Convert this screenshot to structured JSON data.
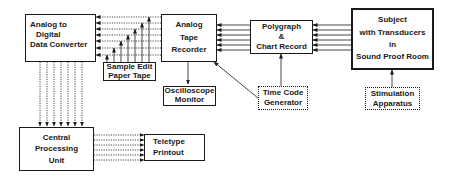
{
  "diagram": {
    "type": "block-diagram",
    "nodes": {
      "adc": {
        "lines": [
          "Analog  to",
          "Digital",
          "Data Converter"
        ],
        "border": "solid"
      },
      "tape": {
        "lines": [
          "Analog",
          "Tape",
          "Recorder"
        ],
        "border": "solid"
      },
      "poly": {
        "lines": [
          "Polygraph",
          "&",
          "Chart  Record"
        ],
        "border": "solid"
      },
      "subject": {
        "lines": [
          "Subject",
          "with Transducers",
          "in",
          "Sound Proof Room"
        ],
        "border": "thick"
      },
      "sample": {
        "lines": [
          "Sample  Edit",
          "Paper  Tape"
        ],
        "border": "solid"
      },
      "osc": {
        "lines": [
          "Oscilloscope",
          "Monitor"
        ],
        "border": "solid"
      },
      "tcg": {
        "lines": [
          "Time Code",
          "Generator"
        ],
        "border": "dotted"
      },
      "stim": {
        "lines": [
          "Stimulation",
          "Apparatus"
        ],
        "border": "dotted"
      },
      "cpu": {
        "lines": [
          "Central",
          "Processing",
          "Unit"
        ],
        "border": "solid"
      },
      "tty": {
        "lines": [
          "Teletype",
          "Printout"
        ],
        "border": "solid"
      }
    },
    "edges": [
      {
        "from": "Subject with Transducers in Sound Proof Room",
        "to": "Polygraph & Chart Record",
        "count": 6,
        "style": "solid"
      },
      {
        "from": "Polygraph & Chart Record",
        "to": "Analog Tape Recorder",
        "count": 6,
        "style": "solid"
      },
      {
        "from": "Analog Tape Recorder",
        "to": "Analog to Digital Data Converter",
        "count": 7,
        "style": "dotted"
      },
      {
        "from": "Sample Edit Paper Tape",
        "to": "Analog Tape Recorder / Converter lines",
        "count": 7,
        "style": "solid"
      },
      {
        "from": "Analog Tape Recorder",
        "to": "Oscilloscope Monitor",
        "count": 1,
        "style": "solid"
      },
      {
        "from": "Time Code Generator",
        "to": "Polygraph & Chart Record",
        "count": 1,
        "style": "solid"
      },
      {
        "from": "Time Code Generator",
        "to": "Analog Tape Recorder",
        "count": 1,
        "style": "solid"
      },
      {
        "from": "Stimulation Apparatus",
        "to": "Subject with Transducers in Sound Proof Room",
        "count": 1,
        "style": "solid"
      },
      {
        "from": "Analog to Digital Data Converter",
        "to": "Central Processing Unit",
        "count": 7,
        "style": "dotted"
      },
      {
        "from": "Central Processing Unit",
        "to": "Teletype Printout",
        "count": 6,
        "style": "dotted"
      }
    ]
  }
}
